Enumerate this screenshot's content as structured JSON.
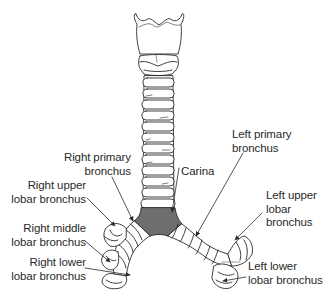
{
  "diagram": {
    "colors": {
      "line": "#2a2a2a",
      "fill": "#ffffff",
      "carina_fill": "#6e6e6e",
      "text": "#2a2a2a"
    },
    "labels": {
      "right_primary": {
        "line1": "Right primary",
        "line2": "bronchus"
      },
      "right_upper": {
        "line1": "Right upper",
        "line2": "lobar bronchus"
      },
      "right_middle": {
        "line1": "Right middle",
        "line2": "lobar bronchus"
      },
      "right_lower": {
        "line1": "Right lower",
        "line2": "lobar bronchus"
      },
      "carina": {
        "line1": "Carina"
      },
      "left_primary": {
        "line1": "Left primary",
        "line2": "bronchus"
      },
      "left_upper": {
        "line1": "Left upper",
        "line2": "lobar",
        "line3": "bronchus"
      },
      "left_lower": {
        "line1": "Left lower",
        "line2": "lobar bronchus"
      }
    }
  }
}
